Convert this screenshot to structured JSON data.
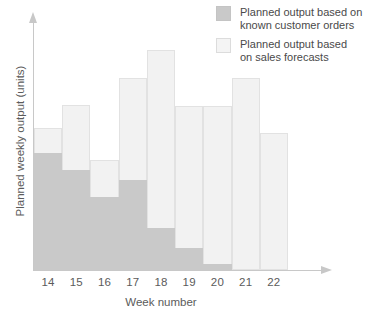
{
  "chart_data": {
    "type": "bar",
    "subtype": "overlapping-stacked-columns",
    "title": "",
    "xlabel": "Week number",
    "ylabel": "Planned weekly output (units)",
    "categories": [
      "14",
      "15",
      "16",
      "17",
      "18",
      "19",
      "20",
      "21",
      "22"
    ],
    "ylim": [
      0,
      250
    ],
    "y_axis_tick_labels": [],
    "grid": false,
    "legend_position": "top-right",
    "series": [
      {
        "name": "Planned output based on known customer orders",
        "color": "#c9c9c9",
        "values": [
          117,
          100,
          73,
          90,
          42,
          22,
          6,
          0,
          0
        ]
      },
      {
        "name": "Planned output based on sales forecasts",
        "color": "#f2f2f2",
        "values": [
          142,
          165,
          110,
          192,
          220,
          164,
          164,
          192,
          137
        ]
      }
    ],
    "annotations": []
  },
  "axes": {
    "x_title": "Week number",
    "y_title": "Planned weekly output (units)",
    "x_tick_labels": [
      "14",
      "15",
      "16",
      "17",
      "18",
      "19",
      "20",
      "21",
      "22"
    ],
    "y_tick_labels": [],
    "x_arrow_icon": "arrow-right-icon",
    "y_arrow_icon": "arrow-up-icon",
    "axis_color": "#c8c8c8"
  },
  "legend": {
    "items": [
      {
        "swatch_kind": "orders",
        "color": "#c9c9c9",
        "label": "Planned output based on\nknown customer orders"
      },
      {
        "swatch_kind": "forecast",
        "color": "#f2f2f2",
        "label": "Planned output based\non sales forecasts"
      }
    ]
  },
  "colors": {
    "orders_fill": "#c9c9c9",
    "forecast_fill": "#f2f2f2",
    "forecast_stroke": "#e2e2e2",
    "axis": "#c8c8c8",
    "text": "#5b5b5b",
    "background": "#ffffff"
  }
}
